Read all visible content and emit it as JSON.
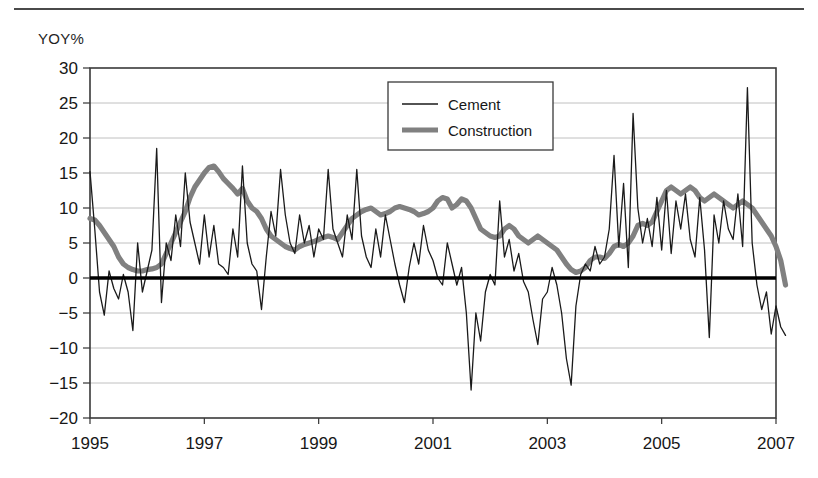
{
  "figure": {
    "axis_label_y": "YOY%"
  },
  "legend": {
    "items": [
      {
        "label": "Cement",
        "style": "thin-line",
        "color": "#1a1a1a",
        "width": 1.3
      },
      {
        "label": "Construction",
        "style": "thick-line",
        "color": "#808080",
        "width": 5.2
      }
    ]
  },
  "chart_data": {
    "type": "line",
    "title": "",
    "xlabel": "",
    "ylabel": "YOY%",
    "ylim": [
      -20,
      30
    ],
    "xlim": [
      1995.0,
      2007.0
    ],
    "yticks": [
      -20,
      -15,
      -10,
      -5,
      0,
      5,
      10,
      15,
      20,
      25,
      30
    ],
    "ytick_labels": [
      "-20",
      "-15",
      "-10",
      "-5",
      "0",
      "5",
      "10",
      "15",
      "20",
      "25",
      "30"
    ],
    "xticks": [
      1995,
      1997,
      1999,
      2001,
      2003,
      2005,
      2007
    ],
    "xtick_labels": [
      "1995",
      "1997",
      "1999",
      "2001",
      "2003",
      "2005",
      "2007"
    ],
    "grid": "horizontal",
    "zero_line": 0,
    "legend_position": "top-center",
    "x_start": 1995.0,
    "x_step": 0.08333333,
    "series": [
      {
        "name": "Cement",
        "color": "#1a1a1a",
        "line_width": 1.3,
        "values": [
          15.2,
          7.0,
          -2.0,
          -5.3,
          1.0,
          -1.5,
          -3.0,
          0.5,
          -2.0,
          -7.5,
          5.0,
          -2.0,
          1.0,
          4.0,
          18.5,
          -3.5,
          5.0,
          2.5,
          9.0,
          4.5,
          15.0,
          8.0,
          5.0,
          2.0,
          9.0,
          3.0,
          7.5,
          2.0,
          1.5,
          0.5,
          7.0,
          3.0,
          16.0,
          5.0,
          2.0,
          1.0,
          -4.5,
          3.0,
          9.5,
          6.0,
          15.5,
          9.0,
          5.0,
          3.5,
          9.0,
          5.0,
          7.5,
          3.0,
          7.0,
          5.5,
          15.5,
          7.0,
          5.0,
          3.0,
          9.0,
          5.5,
          15.5,
          6.0,
          3.0,
          1.5,
          7.0,
          3.0,
          9.0,
          5.5,
          2.0,
          -1.0,
          -3.5,
          1.5,
          5.0,
          2.0,
          7.5,
          4.0,
          2.5,
          0.0,
          -1.0,
          5.0,
          2.0,
          -1.0,
          1.5,
          -5.0,
          -16.0,
          -5.0,
          -9.0,
          -2.0,
          0.5,
          -1.0,
          11.0,
          3.0,
          5.5,
          1.0,
          3.5,
          -0.5,
          -2.0,
          -6.0,
          -9.5,
          -3.0,
          -2.0,
          1.5,
          -1.0,
          -5.0,
          -11.5,
          -15.3,
          -4.0,
          0.5,
          2.0,
          1.0,
          4.5,
          2.0,
          3.0,
          7.0,
          17.5,
          4.5,
          13.5,
          1.5,
          23.5,
          10.0,
          5.0,
          8.5,
          4.5,
          11.5,
          4.0,
          12.5,
          3.5,
          11.0,
          7.0,
          12.0,
          5.5,
          3.0,
          11.5,
          4.0,
          -8.5,
          9.0,
          5.0,
          11.0,
          7.0,
          5.5,
          12.0,
          4.5,
          27.2,
          5.0,
          -1.0,
          -4.5,
          -2.0,
          -8.0,
          -4.0,
          -7.0,
          -8.2
        ]
      },
      {
        "name": "Construction",
        "color": "#808080",
        "line_width": 5.2,
        "values": [
          8.5,
          8.3,
          7.5,
          6.5,
          5.5,
          4.5,
          3.0,
          2.0,
          1.5,
          1.2,
          1.0,
          1.0,
          1.2,
          1.3,
          1.5,
          2.0,
          3.5,
          5.0,
          6.5,
          8.0,
          9.5,
          11.5,
          13.0,
          14.0,
          15.0,
          15.8,
          16.0,
          15.2,
          14.2,
          13.5,
          12.8,
          12.0,
          12.8,
          11.0,
          10.0,
          9.5,
          8.5,
          7.0,
          6.0,
          5.5,
          5.0,
          4.5,
          4.2,
          4.0,
          4.5,
          4.8,
          5.0,
          5.2,
          5.5,
          5.8,
          6.0,
          5.8,
          5.5,
          6.5,
          7.5,
          8.5,
          9.0,
          9.5,
          9.8,
          10.0,
          9.5,
          9.0,
          9.2,
          9.5,
          10.0,
          10.2,
          10.0,
          9.8,
          9.5,
          9.0,
          9.2,
          9.5,
          10.0,
          11.0,
          11.5,
          11.3,
          10.0,
          10.5,
          11.3,
          11.0,
          10.0,
          8.5,
          7.0,
          6.5,
          6.0,
          5.8,
          6.0,
          7.0,
          7.5,
          7.0,
          6.0,
          5.5,
          5.0,
          5.5,
          6.0,
          5.5,
          5.0,
          4.5,
          4.0,
          3.0,
          2.0,
          1.2,
          0.8,
          1.0,
          1.5,
          2.5,
          3.0,
          3.0,
          2.8,
          3.5,
          4.5,
          4.8,
          4.5,
          5.0,
          6.0,
          7.5,
          7.8,
          7.5,
          8.0,
          9.5,
          11.0,
          12.5,
          13.0,
          12.5,
          12.0,
          12.5,
          13.0,
          12.5,
          11.5,
          11.0,
          11.5,
          12.0,
          11.5,
          11.0,
          10.5,
          10.0,
          10.5,
          11.0,
          10.5,
          10.0,
          9.0,
          8.0,
          7.0,
          6.0,
          4.5,
          2.5,
          -1.0
        ]
      }
    ]
  }
}
